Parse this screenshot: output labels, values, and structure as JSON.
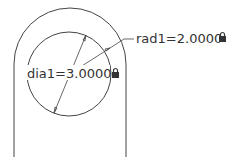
{
  "dimensions": [
    {
      "name": "dia1",
      "label": "dia1=3.0000",
      "type": "diameter",
      "locked": true
    },
    {
      "name": "rad1",
      "label": "rad1=2.0000",
      "type": "radius",
      "locked": true
    }
  ],
  "colors": {
    "stroke": "#444444",
    "text": "#333333",
    "lock": "#333333"
  }
}
